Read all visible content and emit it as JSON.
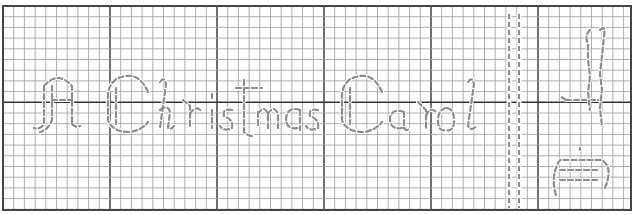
{
  "pattern": {
    "type": "backstitch-chart",
    "title_text": "A Christmas Carol",
    "spine_text": "Dickens",
    "grid": {
      "left": 3,
      "top": 6,
      "right": 631,
      "bottom": 210,
      "cell_size": 10.7,
      "major_every": 10,
      "minor_color": "#9a9a9a",
      "major_color": "#333333"
    },
    "stitch_color": "#8c8c8c",
    "spine_lines_x": [
      509,
      519
    ]
  }
}
